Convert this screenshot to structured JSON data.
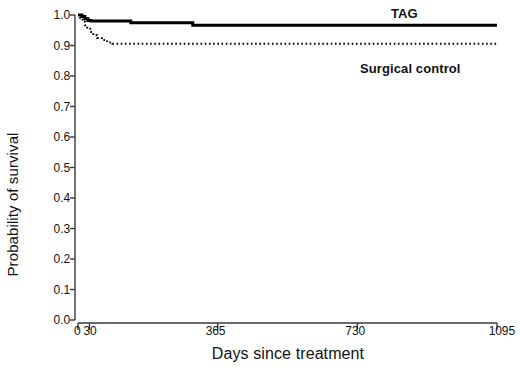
{
  "chart_data": {
    "type": "line",
    "subtype": "kaplan-meier-step",
    "title": "",
    "xlabel": "Days since treatment",
    "ylabel": "Probability of survival",
    "xlim": [
      0,
      1095
    ],
    "ylim": [
      0.0,
      1.0
    ],
    "grid": false,
    "legend_position": "inline-annotations",
    "x_ticks": [
      {
        "value": 0,
        "label": "0"
      },
      {
        "value": 30,
        "label": "30"
      },
      {
        "value": 365,
        "label": "365"
      },
      {
        "value": 730,
        "label": "730"
      },
      {
        "value": 1095,
        "label": "1095"
      }
    ],
    "y_ticks": [
      {
        "value": 0.0,
        "label": "0.0"
      },
      {
        "value": 0.1,
        "label": "0.1"
      },
      {
        "value": 0.2,
        "label": "0.2"
      },
      {
        "value": 0.3,
        "label": "0.3"
      },
      {
        "value": 0.4,
        "label": "0.4"
      },
      {
        "value": 0.5,
        "label": "0.5"
      },
      {
        "value": 0.6,
        "label": "0.6"
      },
      {
        "value": 0.7,
        "label": "0.7"
      },
      {
        "value": 0.8,
        "label": "0.8"
      },
      {
        "value": 0.9,
        "label": "0.9"
      },
      {
        "value": 1.0,
        "label": "1.0"
      }
    ],
    "series": [
      {
        "name": "TAG",
        "label": "TAG",
        "style": "solid",
        "color": "#000000",
        "width": 3,
        "x": [
          0,
          10,
          18,
          26,
          34,
          130,
          138,
          300,
          1095
        ],
        "values": [
          1.0,
          0.995,
          0.988,
          0.982,
          0.98,
          0.98,
          0.975,
          0.966,
          0.966
        ]
      },
      {
        "name": "Surgical control",
        "label": "Surgical control",
        "style": "dotted",
        "color": "#000000",
        "width": 2,
        "x": [
          0,
          6,
          12,
          18,
          24,
          32,
          40,
          50,
          62,
          76,
          90,
          1095
        ],
        "values": [
          1.0,
          0.99,
          0.978,
          0.966,
          0.955,
          0.944,
          0.934,
          0.925,
          0.918,
          0.91,
          0.906,
          0.906
        ]
      }
    ],
    "annotations": [
      {
        "text": "TAG",
        "x": 1010,
        "y": 1.0
      },
      {
        "text": "Surgical control",
        "x": 880,
        "y": 0.845
      }
    ]
  },
  "axes": {
    "y_title": "Probability of survival",
    "x_title": "Days since treatment",
    "axis_color": "#3a3a3a"
  },
  "labels": {
    "tag": "TAG",
    "surgical_control": "Surgical control"
  },
  "y_tick_labels": [
    "1.0",
    "0.9",
    "0.8",
    "0.7",
    "0.6",
    "0.5",
    "0.4",
    "0.3",
    "0.2",
    "0.1",
    "0.0"
  ],
  "x_tick_labels": [
    "0",
    "30",
    "365",
    "730",
    "1095"
  ]
}
